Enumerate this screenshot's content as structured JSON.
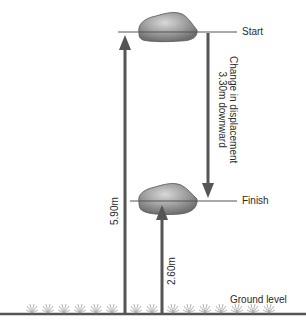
{
  "diagram": {
    "labels": {
      "start": "Start",
      "finish": "Finish",
      "ground": "Ground level",
      "start_height": "5.90m",
      "finish_height": "2.60m",
      "displacement_line1": "Change in displacement",
      "displacement_line2": "3.30m downward"
    },
    "colors": {
      "arrow": "#555555",
      "line": "#666666",
      "rock": "#8c8c8c",
      "grass": "#9a9a9a"
    }
  }
}
